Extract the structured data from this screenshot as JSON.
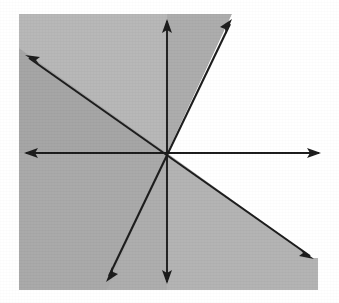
{
  "figure": {
    "title": "Shaded region bounded by rays through a common origin",
    "canvas": {
      "width": 339,
      "height": 303,
      "background_color": "#ffffff"
    },
    "origin": {
      "x": 167,
      "y": 153,
      "label": "origin"
    },
    "shading": {
      "plate_color": "#b2b2b2",
      "plate_dark_color": "#a2a2a2",
      "plate_mid_color": "#aaaaaa",
      "unshaded_color": "#ffffff",
      "plate_rect": {
        "x": 19,
        "y": 14,
        "width": 299,
        "height": 276
      },
      "notch_description": "white wedge in upper right between the steep ray and the right horizontal ray"
    },
    "lines": [
      {
        "name": "horizontal-axis",
        "orientation": "horizontal",
        "from": {
          "x": 25,
          "y": 153
        },
        "to": {
          "x": 320,
          "y": 153
        },
        "arrow_start": true,
        "arrow_end": true,
        "color": "#1a1a1a"
      },
      {
        "name": "vertical-axis",
        "orientation": "vertical",
        "from": {
          "x": 167,
          "y": 20
        },
        "to": {
          "x": 167,
          "y": 283
        },
        "arrow_start": true,
        "arrow_end": true,
        "color": "#1a1a1a"
      },
      {
        "name": "steep-diagonal",
        "orientation": "steep-positive-slope",
        "from": {
          "x": 107,
          "y": 280
        },
        "to": {
          "x": 232,
          "y": 20
        },
        "arrow_start": true,
        "arrow_end": true,
        "color": "#1a1a1a"
      },
      {
        "name": "shallow-diagonal",
        "orientation": "shallow-negative-slope",
        "from": {
          "x": 26,
          "y": 56
        },
        "to": {
          "x": 313,
          "y": 258
        },
        "arrow_start": true,
        "arrow_end": true,
        "color": "#1a1a1a"
      }
    ],
    "rays": [
      {
        "name": "ray-right",
        "direction": "east",
        "tip": {
          "x": 320,
          "y": 153
        }
      },
      {
        "name": "ray-left",
        "direction": "west",
        "tip": {
          "x": 25,
          "y": 153
        }
      },
      {
        "name": "ray-up",
        "direction": "north",
        "tip": {
          "x": 167,
          "y": 20
        }
      },
      {
        "name": "ray-down",
        "direction": "south",
        "tip": {
          "x": 167,
          "y": 283
        }
      },
      {
        "name": "ray-upper-right",
        "direction": "northeast-steep",
        "tip": {
          "x": 232,
          "y": 20
        }
      },
      {
        "name": "ray-lower-left",
        "direction": "southwest-steep",
        "tip": {
          "x": 107,
          "y": 280
        }
      },
      {
        "name": "ray-upper-left",
        "direction": "northwest-shallow",
        "tip": {
          "x": 26,
          "y": 56
        }
      },
      {
        "name": "ray-lower-right",
        "direction": "southeast-shallow",
        "tip": {
          "x": 313,
          "y": 258
        }
      }
    ],
    "arrow_head": {
      "length": 13,
      "half_width": 4.6,
      "color": "#1a1a1a"
    }
  }
}
